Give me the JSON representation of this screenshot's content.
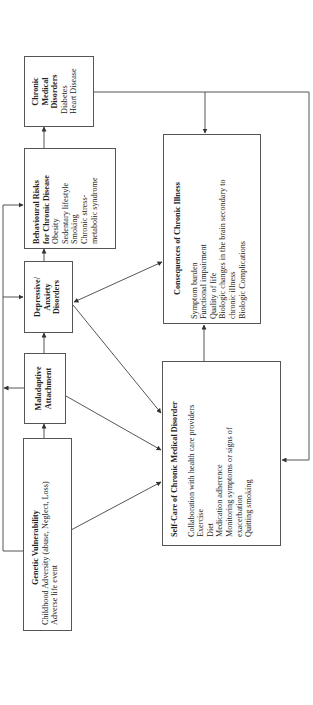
{
  "diagram": {
    "orientation": "rotated-90-ccw",
    "boxes": {
      "chronic_medical": {
        "title_lines": [
          "Chronic",
          "Medical",
          "Disorders"
        ],
        "items": [
          "Diabetes",
          "Heart Disease"
        ]
      },
      "behavioural_risks": {
        "title_lines": [
          "Behavioural Risks",
          "for Chronic Disease"
        ],
        "items": [
          "Obesity",
          "Sedentary lifestyle",
          "Smoking",
          "Chronic stress-",
          "metabolic syndrome"
        ]
      },
      "depressive": {
        "title_lines": [
          "Depressive/",
          "Anxiety",
          "Disorders"
        ]
      },
      "maladaptive": {
        "title_lines": [
          "Maladaptive",
          "Attachment"
        ]
      },
      "genetic": {
        "title": "Genetic Vulnerability",
        "items": [
          "Childhood Adversity (abuse, Neglect, Loss)",
          "Adverse life event"
        ]
      },
      "consequences": {
        "title": "Consequences of Chronic Illness",
        "items": [
          "Symptom burden",
          "Functional impairment",
          "Quality of life",
          "Biologic changes in the brain secondary to",
          "chronic illness",
          "Biologic Complications"
        ]
      },
      "self_care": {
        "title": "Self-Care of Chronic Medical Disorder",
        "items": [
          "Collaboration with health care providers",
          "Exercise",
          "Diet",
          "Medication adherence",
          "Monitoring symptoms or signs of",
          "exacerbation",
          "Quitting smoking"
        ]
      }
    },
    "connections": [
      {
        "from": "genetic",
        "to": "maladaptive",
        "type": "arrow"
      },
      {
        "from": "maladaptive",
        "to": "depressive",
        "type": "arrow"
      },
      {
        "from": "depressive",
        "to": "behavioural_risks",
        "type": "arrow"
      },
      {
        "from": "behavioural_risks",
        "to": "chronic_medical",
        "type": "arrow"
      },
      {
        "from": "genetic",
        "to": "behavioural_risks",
        "type": "arrow",
        "route": "left-bus"
      },
      {
        "from": "genetic",
        "to": "depressive",
        "type": "arrow",
        "route": "left-bus"
      },
      {
        "from": "maladaptive",
        "to": "left-bus",
        "type": "arrow"
      },
      {
        "from": "depressive",
        "to": "consequences",
        "type": "double-arrow"
      },
      {
        "from": "depressive",
        "to": "self_care",
        "type": "arrow"
      },
      {
        "from": "maladaptive",
        "to": "self_care",
        "type": "arrow"
      },
      {
        "from": "genetic",
        "to": "self_care",
        "type": "arrow"
      },
      {
        "from": "self_care",
        "to": "consequences",
        "type": "arrow"
      },
      {
        "from": "chronic_medical",
        "to": "consequences",
        "type": "arrow"
      },
      {
        "from": "chronic_medical",
        "to": "self_care",
        "type": "arrow",
        "route": "right-bus"
      }
    ],
    "colors": {
      "line": "#555555",
      "text": "#222222",
      "background": "#ffffff"
    }
  }
}
